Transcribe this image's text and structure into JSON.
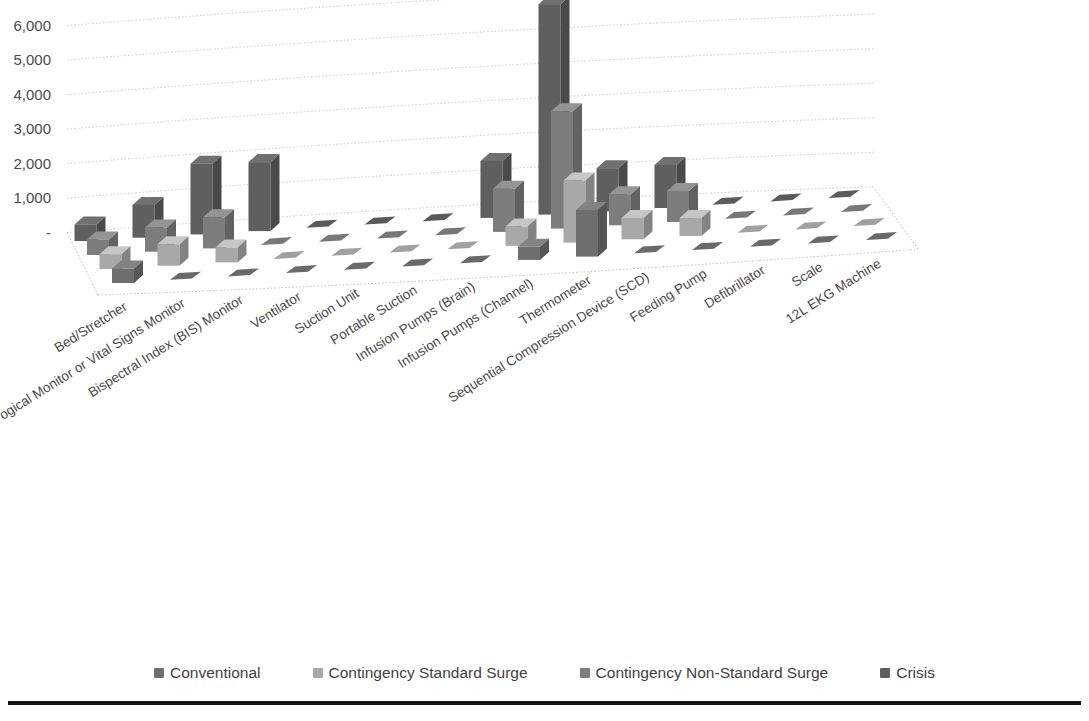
{
  "chart_data": {
    "type": "bar",
    "render": "3d-grouped-bar",
    "title": "",
    "subtitle": "",
    "xlabel": "",
    "ylabel": "",
    "ylim": [
      0,
      7000
    ],
    "ytick_labels": [
      "-",
      "1,000",
      "2,000",
      "3,000",
      "4,000",
      "5,000",
      "6,000",
      "7,000"
    ],
    "ytick_values": [
      0,
      1000,
      2000,
      3000,
      4000,
      5000,
      6000,
      7000
    ],
    "grid": true,
    "legend_position": "bottom",
    "categories": [
      "Bed/Stretcher",
      "Physiological Monitor or Vital Signs Monitor",
      "Bispectral Index (BIS) Monitor",
      "Ventilator",
      "Suction Unit",
      "Portable Suction",
      "Infusion Pumps (Brain)",
      "Infusion Pumps (Channel)",
      "Thermometer",
      "Sequential Compression Device (SCD)",
      "Feeding Pump",
      "Defibrillator",
      "Scale",
      "12L EKG Machine"
    ],
    "category_labels_visible": [
      "Bed/Stretcher",
      "ogical Monitor or Vital Signs Monitor",
      "Bispectral Index (BIS) Monitor",
      "Ventilator",
      "Suction Unit",
      "Portable Suction",
      "Infusion Pumps (Brain)",
      "Infusion Pumps (Channel)",
      "Thermometer",
      "Sequential Compression Device (SCD)",
      "Feeding Pump",
      "Defibrillator",
      "Scale",
      "12L EKG Machine"
    ],
    "series": [
      {
        "name": "Conventional",
        "color": "#6e6e6e",
        "values": [
          420,
          0,
          0,
          0,
          0,
          0,
          0,
          380,
          1350,
          0,
          0,
          0,
          0,
          0
        ]
      },
      {
        "name": "Contingency Standard Surge",
        "color": "#a8a8a8",
        "values": [
          430,
          620,
          430,
          0,
          0,
          0,
          0,
          560,
          1800,
          620,
          520,
          0,
          0,
          0
        ]
      },
      {
        "name": "Contingency Non-Standard Surge",
        "color": "#7d7d7d",
        "values": [
          450,
          700,
          900,
          0,
          0,
          0,
          0,
          1250,
          3400,
          900,
          900,
          0,
          0,
          0
        ]
      },
      {
        "name": "Crisis",
        "color": "#5f5f5f",
        "values": [
          480,
          950,
          2050,
          2000,
          0,
          0,
          0,
          1650,
          6100,
          1250,
          1250,
          0,
          0,
          0
        ]
      }
    ]
  },
  "legend": {
    "items": [
      {
        "label": "Conventional",
        "color": "#6e6e6e"
      },
      {
        "label": "Contingency Standard Surge",
        "color": "#a8a8a8"
      },
      {
        "label": "Contingency Non-Standard Surge",
        "color": "#7d7d7d"
      },
      {
        "label": "Crisis",
        "color": "#5f5f5f"
      }
    ]
  }
}
